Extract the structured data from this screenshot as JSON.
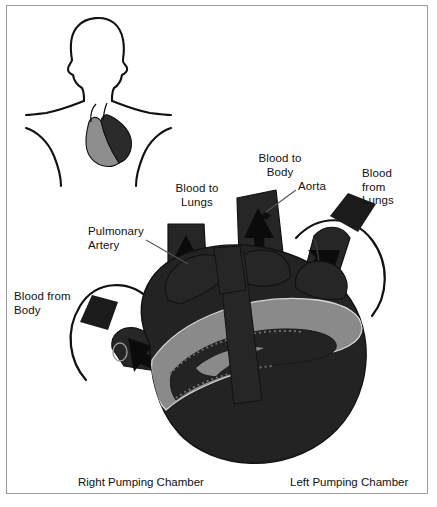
{
  "figure": {
    "border_color": "#9a9a9a",
    "background": "#ffffff"
  },
  "colors": {
    "heart_dark": "#232323",
    "heart_darker": "#141414",
    "vessel_dark": "#262626",
    "groove_gray": "#8a8a8a",
    "outline": "#111111",
    "inset_gray": "#8e8e8e",
    "text": "#111111",
    "leader_line": "#555555"
  },
  "inset": {
    "name": "torso-silhouette",
    "description": "Head and shoulders outline with heart located in chest",
    "heart_left_shade": "#8e8e8e",
    "heart_right_shade": "#2b2b2b"
  },
  "labels": [
    {
      "id": "blood-to-lungs",
      "text": "Blood to\nLungs",
      "x": 166,
      "y": 182,
      "align": "center",
      "width": 62
    },
    {
      "id": "blood-to-body",
      "text": "Blood to\nBody",
      "x": 250,
      "y": 152,
      "align": "center",
      "width": 60
    },
    {
      "id": "aorta",
      "text": "Aorta",
      "x": 298,
      "y": 180,
      "align": "left",
      "width": 42
    },
    {
      "id": "blood-from-lungs",
      "text": "Blood\nfrom\nLungs",
      "x": 362,
      "y": 167,
      "align": "left",
      "width": 48
    },
    {
      "id": "pulmonary-artery",
      "text": "Pulmonary\nArtery",
      "x": 88,
      "y": 225,
      "align": "left",
      "width": 72
    },
    {
      "id": "blood-from-body",
      "text": "Blood from\nBody",
      "x": 14,
      "y": 290,
      "align": "left",
      "width": 72
    }
  ],
  "captions": [
    {
      "id": "right-pumping-chamber",
      "text": "Right Pumping Chamber",
      "x": 78,
      "y": 476
    },
    {
      "id": "left-pumping-chamber",
      "text": "Left Pumping Chamber",
      "x": 290,
      "y": 476
    }
  ],
  "flow_arrows": [
    {
      "id": "pulmonary-artery-arrow",
      "direction": "up",
      "meaning": "Blood to Lungs"
    },
    {
      "id": "aorta-arrow",
      "direction": "up",
      "meaning": "Blood to Body"
    },
    {
      "id": "pulmonary-vein-arrow",
      "direction": "down-left",
      "meaning": "Blood from Lungs"
    },
    {
      "id": "vena-cava-arrow",
      "direction": "down-right",
      "meaning": "Blood from Body"
    },
    {
      "id": "right-sweep-arrow",
      "direction": "curved-clockwise",
      "meaning": "Blood from Lungs entering"
    },
    {
      "id": "left-sweep-arrow",
      "direction": "curved-counterclockwise",
      "meaning": "Blood from Body entering"
    }
  ]
}
